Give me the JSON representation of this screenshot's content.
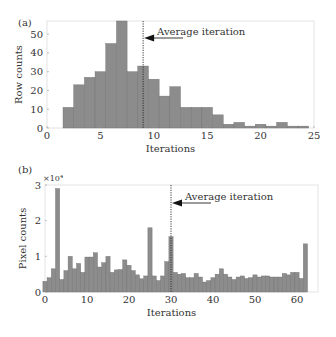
{
  "chart_data": [
    {
      "type": "bar",
      "panel_label": "(a)",
      "title": "",
      "xlabel": "Iterations",
      "ylabel": "Row counts",
      "xlim": [
        0,
        25
      ],
      "ylim": [
        0,
        57
      ],
      "xticks": [
        0,
        5,
        10,
        15,
        20,
        25
      ],
      "yticks": [
        0,
        10,
        20,
        30,
        40,
        50
      ],
      "grid": false,
      "bar_color": "#8c8c8c",
      "x": [
        2,
        3,
        4,
        5,
        6,
        7,
        8,
        9,
        10,
        11,
        12,
        13,
        14,
        15,
        16,
        17,
        18,
        19,
        20,
        21,
        22,
        23,
        24
      ],
      "values": [
        11,
        23,
        27,
        30,
        45,
        57,
        30,
        33,
        26,
        17,
        22,
        11,
        11,
        11,
        7,
        2,
        3,
        1,
        2,
        1,
        3,
        1,
        1
      ],
      "annotation": {
        "text": "Average iteration",
        "x": 9
      }
    },
    {
      "type": "bar",
      "panel_label": "(b)",
      "title": "",
      "xlabel": "Iterations",
      "ylabel": "Pixel counts",
      "y_multiplier": "×10⁴",
      "xlim": [
        0,
        65
      ],
      "ylim": [
        0,
        3
      ],
      "xticks": [
        0,
        10,
        20,
        30,
        40,
        50,
        60
      ],
      "yticks": [
        0,
        1,
        2,
        3
      ],
      "grid": false,
      "bar_color": "#8c8c8c",
      "x": [
        0,
        1,
        2,
        3,
        4,
        5,
        6,
        7,
        8,
        9,
        10,
        11,
        12,
        13,
        14,
        15,
        16,
        17,
        18,
        19,
        20,
        21,
        22,
        23,
        24,
        25,
        26,
        27,
        28,
        29,
        30,
        31,
        32,
        33,
        34,
        35,
        36,
        37,
        38,
        39,
        40,
        41,
        42,
        43,
        44,
        45,
        46,
        47,
        48,
        49,
        50,
        51,
        52,
        53,
        54,
        55,
        56,
        57,
        58,
        59,
        60,
        61,
        62
      ],
      "values": [
        0.3,
        0.4,
        0.65,
        2.9,
        0.35,
        0.6,
        1.0,
        0.65,
        0.8,
        0.55,
        0.98,
        0.98,
        1.1,
        0.7,
        0.82,
        1.0,
        0.55,
        0.62,
        0.63,
        0.9,
        0.75,
        0.6,
        0.48,
        0.37,
        0.45,
        1.8,
        0.45,
        0.32,
        0.45,
        0.85,
        1.55,
        0.55,
        0.5,
        0.52,
        0.4,
        0.4,
        0.52,
        0.42,
        0.28,
        0.32,
        0.4,
        0.5,
        0.65,
        0.5,
        0.42,
        0.35,
        0.42,
        0.45,
        0.38,
        0.4,
        0.48,
        0.42,
        0.45,
        0.45,
        0.42,
        0.42,
        0.42,
        0.52,
        0.48,
        0.55,
        0.55,
        0.38,
        1.35
      ],
      "annotation": {
        "text": "Average iteration",
        "x": 30
      }
    }
  ]
}
